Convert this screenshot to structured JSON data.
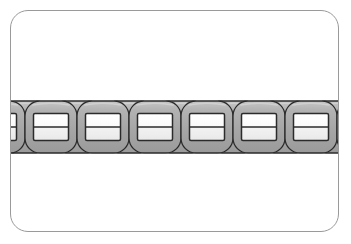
{
  "illustration": {
    "title": "Chain",
    "subject": "interlocking-chain",
    "alt_text": "A horizontal row of interlocking rectangular chain links",
    "background_color": "#ffffff"
  },
  "card": {
    "border_color": "#9a9a9a",
    "fill_color": "#ffffff",
    "corner_radius": 18,
    "x": 10,
    "y": 10,
    "width": 329,
    "height": 222
  },
  "chain": {
    "orientation": "horizontal",
    "link_count": 8,
    "link_pitch": 51,
    "link_width": 52,
    "link_height": 52,
    "band_top": 96,
    "band_bottom": 150,
    "center_y": 123,
    "colors": {
      "link_body": "#a8a8a8",
      "link_body_light": "#c2c2c2",
      "link_body_shadow": "#8e8e8e",
      "link_outline": "#2b2b2b",
      "inner_fill": "#fbfbfb",
      "inner_fill_lower": "#efefef",
      "inner_divider": "#2b2b2b"
    },
    "links": [
      {
        "index": 1,
        "center_x": 14,
        "layer": "back"
      },
      {
        "index": 2,
        "center_x": 40,
        "layer": "front"
      },
      {
        "index": 3,
        "center_x": 66,
        "layer": "back"
      },
      {
        "index": 4,
        "center_x": 92,
        "layer": "front"
      },
      {
        "index": 5,
        "center_x": 118,
        "layer": "back"
      },
      {
        "index": 6,
        "center_x": 144,
        "layer": "front"
      },
      {
        "index": 7,
        "center_x": 170,
        "layer": "back"
      },
      {
        "index": 8,
        "center_x": 196,
        "layer": "front"
      },
      {
        "index": 9,
        "center_x": 222,
        "layer": "back"
      },
      {
        "index": 10,
        "center_x": 248,
        "layer": "front"
      },
      {
        "index": 11,
        "center_x": 274,
        "layer": "back"
      },
      {
        "index": 12,
        "center_x": 300,
        "layer": "front"
      },
      {
        "index": 13,
        "center_x": 326,
        "layer": "back"
      },
      {
        "index": 14,
        "center_x": 352,
        "layer": "front"
      }
    ]
  }
}
